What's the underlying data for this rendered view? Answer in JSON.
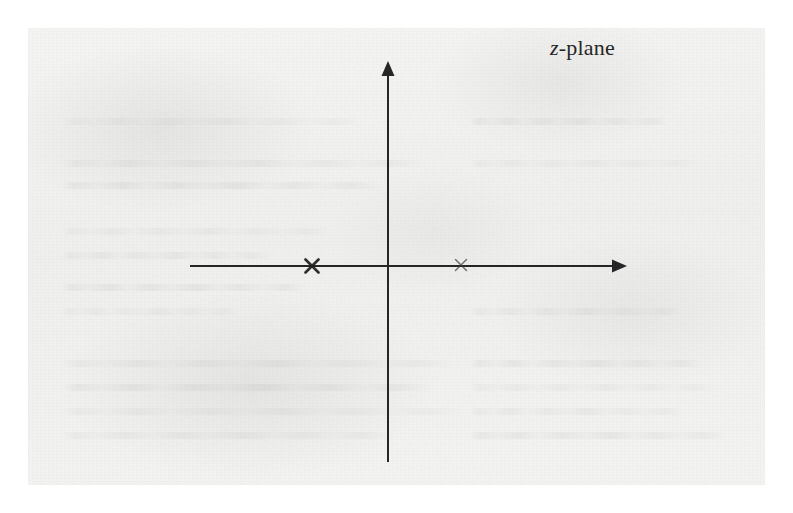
{
  "figure": {
    "label": "z-plane",
    "label_symbol": "z",
    "label_suffix": "-plane",
    "caption_present": false,
    "background_color": "#f2f2f0",
    "ink_color": "#262626",
    "page_border_color": "#ffffff"
  },
  "axes": {
    "real_axis": {
      "name": "real-axis",
      "y": 266,
      "x_start": 190,
      "x_end": 625,
      "arrow_at": "end",
      "stroke_width": 2
    },
    "imag_axis": {
      "name": "imaginary-axis",
      "x": 388,
      "y_start": 62,
      "y_end": 462,
      "arrow_at": "start",
      "stroke_width": 2
    },
    "origin": {
      "x": 388,
      "y": 266
    }
  },
  "chart_data": {
    "type": "scatter",
    "title": "z-plane",
    "xlabel": "",
    "ylabel": "",
    "grid": false,
    "legend": null,
    "axis_style": "arrowed-cartesian",
    "xlim": [
      -2.6,
      2.8
    ],
    "ylim": [
      -2.4,
      2.4
    ],
    "series": [
      {
        "name": "poles",
        "marker": "x",
        "values": [
          {
            "label": "pole-left",
            "x": -0.95,
            "y": 0,
            "px": 312,
            "py": 266,
            "weight": "bold",
            "size": 13
          },
          {
            "label": "pole-right",
            "x": 0.45,
            "y": 0,
            "px": 461,
            "py": 266,
            "weight": "light",
            "size": 11
          }
        ]
      }
    ],
    "annotations": [
      {
        "text": "z-plane",
        "px": 553,
        "py": 51,
        "style": "italic-z-serif"
      }
    ]
  },
  "markers": [
    {
      "name": "pole-marker-left",
      "glyph": "x",
      "cx": 312,
      "cy": 266,
      "half": 6.5,
      "stroke": 2.6,
      "opacity": 0.92,
      "color": "#1f1f1f"
    },
    {
      "name": "pole-marker-right",
      "glyph": "x",
      "cx": 461,
      "cy": 265,
      "half": 5.5,
      "stroke": 1.5,
      "opacity": 0.7,
      "color": "#3a3a3a"
    }
  ],
  "ghost_text_lines": [
    {
      "left": 62,
      "top": 118,
      "width": 300
    },
    {
      "left": 62,
      "top": 160,
      "width": 360
    },
    {
      "left": 62,
      "top": 182,
      "width": 318
    },
    {
      "left": 62,
      "top": 228,
      "width": 268
    },
    {
      "left": 62,
      "top": 252,
      "width": 208
    },
    {
      "left": 62,
      "top": 284,
      "width": 244
    },
    {
      "left": 62,
      "top": 308,
      "width": 176
    },
    {
      "left": 62,
      "top": 360,
      "width": 392
    },
    {
      "left": 62,
      "top": 384,
      "width": 368
    },
    {
      "left": 62,
      "top": 408,
      "width": 404
    },
    {
      "left": 62,
      "top": 432,
      "width": 330
    },
    {
      "left": 470,
      "top": 118,
      "width": 200
    },
    {
      "left": 470,
      "top": 160,
      "width": 226
    },
    {
      "left": 470,
      "top": 308,
      "width": 212
    },
    {
      "left": 470,
      "top": 360,
      "width": 232
    },
    {
      "left": 470,
      "top": 384,
      "width": 248
    },
    {
      "left": 470,
      "top": 408,
      "width": 214
    },
    {
      "left": 470,
      "top": 432,
      "width": 256
    }
  ]
}
